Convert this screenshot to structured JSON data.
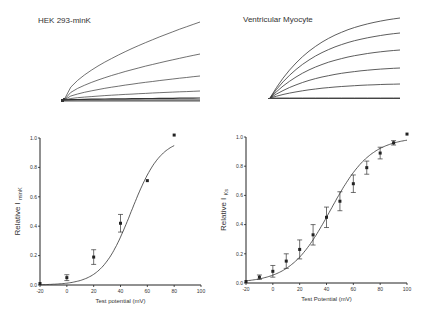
{
  "panels": {
    "top_left_title": "HEK 293-minK",
    "top_right_title": "Ventricular Myocyte"
  },
  "chart_data": [
    {
      "type": "line",
      "title": "HEK 293-minK current traces",
      "description": "Family of current traces (5-6 traces) rising over time",
      "series_count": 6
    },
    {
      "type": "line",
      "title": "Ventricular Myocyte current traces",
      "description": "Family of current traces (6 traces) rising over time",
      "series_count": 6
    },
    {
      "type": "scatter",
      "title": "",
      "xlabel": "Test potential (mV)",
      "ylabel": "Relative I minK",
      "ylabel_main": "Relative I",
      "ylabel_sub": "minK",
      "xlim": [
        -20,
        100
      ],
      "ylim": [
        0,
        1.0
      ],
      "xticks": [
        -20,
        0,
        20,
        40,
        60,
        80,
        100
      ],
      "yticks": [
        "0.0",
        "0.2",
        "0.4",
        "0.6",
        "0.8",
        "1.0"
      ],
      "x": [
        -20,
        0,
        20,
        40,
        60,
        80
      ],
      "values": [
        0.01,
        0.05,
        0.19,
        0.42,
        0.71,
        1.02
      ],
      "errors": [
        0.005,
        0.02,
        0.05,
        0.06,
        0.005,
        0.005
      ],
      "fit": "boltzmann"
    },
    {
      "type": "scatter",
      "title": "",
      "xlabel": "Test Potential (mV)",
      "ylabel": "Relative I Ks",
      "ylabel_main": "Relative I",
      "ylabel_sub": "Ks",
      "xlim": [
        -20,
        100
      ],
      "ylim": [
        0,
        1.0
      ],
      "xticks": [
        -20,
        0,
        20,
        40,
        60,
        80,
        100
      ],
      "yticks": [
        "0.0",
        "0.2",
        "0.4",
        "0.6",
        "0.8",
        "1.0"
      ],
      "x": [
        -20,
        -10,
        0,
        10,
        20,
        30,
        40,
        50,
        60,
        70,
        80,
        90,
        100
      ],
      "values": [
        0.01,
        0.04,
        0.08,
        0.15,
        0.23,
        0.33,
        0.45,
        0.56,
        0.68,
        0.79,
        0.89,
        0.96,
        1.02
      ],
      "errors": [
        0.005,
        0.015,
        0.04,
        0.05,
        0.065,
        0.07,
        0.07,
        0.065,
        0.06,
        0.045,
        0.04,
        0.015,
        0.005
      ],
      "fit": "boltzmann"
    }
  ]
}
